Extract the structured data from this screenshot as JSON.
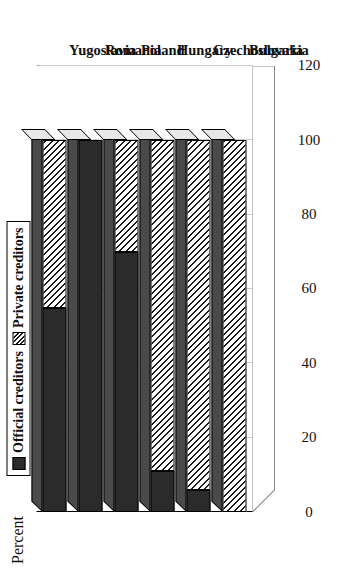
{
  "chart_data": {
    "type": "bar",
    "orientation": "horizontal-stacked-3d",
    "title": "",
    "xlabel": "",
    "ylabel": "Percent",
    "categories": [
      "Bulgaria",
      "Czechoslovakia",
      "Hungary",
      "Poland",
      "Romania",
      "Yugoslavia"
    ],
    "series": [
      {
        "name": "Official creditors",
        "values": [
          0,
          6,
          11,
          70,
          100,
          55
        ]
      },
      {
        "name": "Private creditors",
        "values": [
          100,
          94,
          89,
          30,
          0,
          45
        ]
      }
    ],
    "ylim": [
      0,
      120
    ],
    "ticks": [
      "0",
      "20",
      "40",
      "60",
      "80",
      "100",
      "120"
    ],
    "tick_values": [
      0,
      20,
      40,
      60,
      80,
      100,
      120
    ],
    "grid": true,
    "legend_position": "top-left",
    "stacked": true,
    "totals": [
      100,
      100,
      100,
      100,
      100,
      100
    ]
  },
  "axis": {
    "value_axis_title": "Percent",
    "tick_labels": [
      "0",
      "20",
      "40",
      "60",
      "80",
      "100",
      "120"
    ]
  },
  "legend": {
    "items": [
      {
        "label": "Official creditors",
        "swatch": "official-swatch-icon",
        "color": "#2b2b2b"
      },
      {
        "label": "Private creditors",
        "swatch": "private-hatch-swatch-icon",
        "color": "#ffffff"
      }
    ]
  },
  "categories": [
    {
      "label": "Bulgaria"
    },
    {
      "label": "Czechoslovakia"
    },
    {
      "label": "Hungary"
    },
    {
      "label": "Poland"
    },
    {
      "label": "Romania"
    },
    {
      "label": "Yugoslavia"
    }
  ],
  "colors": {
    "official": "#2b2b2b",
    "private_base": "#ffffff",
    "private_hatch": "#1a1a1a",
    "bar_top": "#4a4a4a",
    "bar_cap": "#e8e8e8",
    "grid": "#9a9a9a",
    "axis": "#000000",
    "background": "#ffffff"
  }
}
